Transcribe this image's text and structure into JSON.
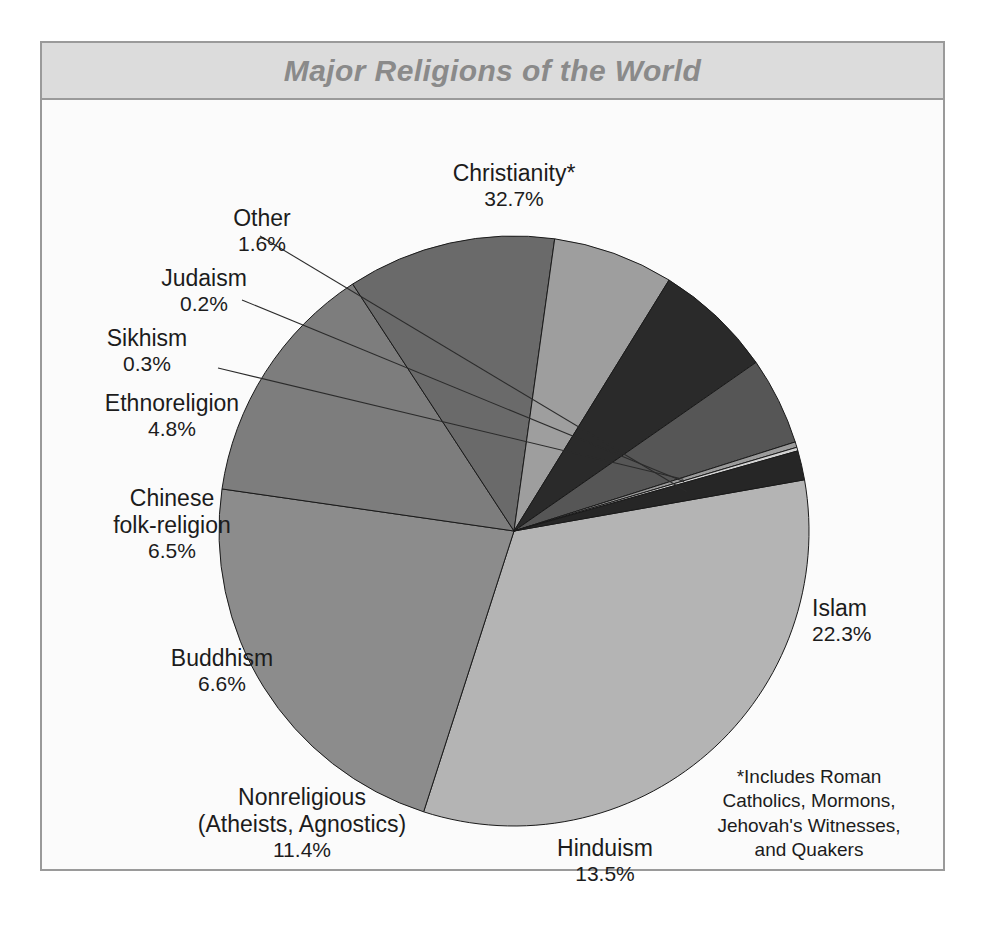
{
  "header": {
    "title": "Major Religions of the World"
  },
  "footnote": {
    "lines": [
      "*Includes Roman",
      "Catholics, Mormons,",
      "Jehovah's Witnesses,",
      "and Quakers"
    ]
  },
  "colors": {
    "frame_border": "#9a9a9a",
    "header_band": "#dcdcdc",
    "title_text": "#8a8a8a",
    "plot_background": "#fbfbfb",
    "label_text": "#1c1c1c",
    "slice_outline": "#1a1a1a"
  },
  "chart_data": {
    "type": "pie",
    "title": "Major Religions of the World",
    "start_angle_deg": -10,
    "direction": "clockwise",
    "total": 100.0,
    "units": "percent",
    "legend_position": "none",
    "grid": false,
    "labels_outside": true,
    "categories": [
      "Christianity*",
      "Islam",
      "Hinduism",
      "Nonreligious (Atheists, Agnostics)",
      "Buddhism",
      "Chinese folk-religion",
      "Ethnoreligion",
      "Sikhism",
      "Judaism",
      "Other"
    ],
    "values": [
      32.7,
      22.3,
      13.5,
      11.4,
      6.6,
      6.5,
      4.8,
      0.3,
      0.2,
      1.6
    ],
    "slices": [
      {
        "id": "christianity",
        "name": "Christianity*",
        "value": 32.7,
        "percent_label": "32.7%",
        "color": "#b4b4b4",
        "label_lines": [
          "Christianity*"
        ],
        "leader": false
      },
      {
        "id": "islam",
        "name": "Islam",
        "value": 22.3,
        "percent_label": "22.3%",
        "color": "#8c8c8c",
        "label_lines": [
          "Islam"
        ],
        "leader": false
      },
      {
        "id": "hinduism",
        "name": "Hinduism",
        "value": 13.5,
        "percent_label": "13.5%",
        "color": "#7d7d7d",
        "label_lines": [
          "Hinduism"
        ],
        "leader": false
      },
      {
        "id": "nonreligious",
        "name": "Nonreligious (Atheists, Agnostics)",
        "value": 11.4,
        "percent_label": "11.4%",
        "color": "#6a6a6a",
        "label_lines": [
          "Nonreligious",
          "(Atheists, Agnostics)"
        ],
        "leader": false
      },
      {
        "id": "buddhism",
        "name": "Buddhism",
        "value": 6.6,
        "percent_label": "6.6%",
        "color": "#9e9e9e",
        "label_lines": [
          "Buddhism"
        ],
        "leader": false
      },
      {
        "id": "chinese-folk-religion",
        "name": "Chinese folk-religion",
        "value": 6.5,
        "percent_label": "6.5%",
        "color": "#2a2a2a",
        "label_lines": [
          "Chinese",
          "folk-religion"
        ],
        "leader": false
      },
      {
        "id": "ethnoreligion",
        "name": "Ethnoreligion",
        "value": 4.8,
        "percent_label": "4.8%",
        "color": "#565656",
        "label_lines": [
          "Ethnoreligion"
        ],
        "leader": false
      },
      {
        "id": "sikhism",
        "name": "Sikhism",
        "value": 0.3,
        "percent_label": "0.3%",
        "color": "#9b9b9b",
        "label_lines": [
          "Sikhism"
        ],
        "leader": true
      },
      {
        "id": "judaism",
        "name": "Judaism",
        "value": 0.2,
        "percent_label": "0.2%",
        "color": "#d2d2d2",
        "label_lines": [
          "Judaism"
        ],
        "leader": true
      },
      {
        "id": "other",
        "name": "Other",
        "value": 1.6,
        "percent_label": "1.6%",
        "color": "#262626",
        "label_lines": [
          "Other"
        ],
        "leader": true
      }
    ]
  },
  "labels": {
    "christianity": {
      "name": "Christianity*",
      "pct": "32.7%"
    },
    "islam": {
      "name": "Islam",
      "pct": "22.3%"
    },
    "hinduism": {
      "name": "Hinduism",
      "pct": "13.5%"
    },
    "nonreligious_l1": "Nonreligious",
    "nonreligious_l2": "(Atheists, Agnostics)",
    "nonreligious_pct": "11.4%",
    "buddhism": {
      "name": "Buddhism",
      "pct": "6.6%"
    },
    "chinese_l1": "Chinese",
    "chinese_l2": "folk-religion",
    "chinese_pct": "6.5%",
    "ethnoreligion": {
      "name": "Ethnoreligion",
      "pct": "4.8%"
    },
    "sikhism": {
      "name": "Sikhism",
      "pct": "0.3%"
    },
    "judaism": {
      "name": "Judaism",
      "pct": "0.2%"
    },
    "other": {
      "name": "Other",
      "pct": "1.6%"
    }
  }
}
